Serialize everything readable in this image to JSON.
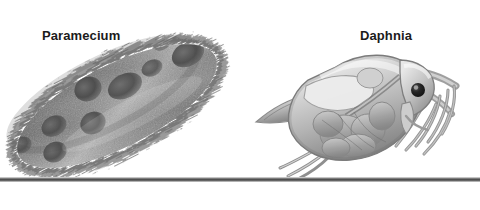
{
  "figure": {
    "background_color": "#ffffff",
    "width": 480,
    "height": 210,
    "style": "grayscale scientific illustration"
  },
  "labels": {
    "paramecium": "Paramecium",
    "daphnia": "Daphnia"
  },
  "organisms": [
    {
      "name": "Paramecium",
      "common_name": "slipper animalcule",
      "description": "Elongated cigar-shaped single-celled ciliate oriented diagonally from upper right to lower left, covered in a dense fringe of cilia, with granular cytoplasm and several dark rounded food vacuoles.",
      "orientation": "diagonal, upper-right to lower-left",
      "features": [
        "cilia fringe",
        "food vacuoles",
        "granular cytoplasm",
        "pellicle"
      ]
    },
    {
      "name": "Daphnia",
      "common_name": "water flea",
      "description": "Small crustacean shown in lateral view with a transparent bivalved carapace, large branched swimming antennae, a single dark compound eye, internal gut and brood chamber, a pointed tail spine and post-abdominal claws.",
      "orientation": "lateral view, head to the right",
      "features": [
        "carapace",
        "compound eye",
        "branched swimming antennae",
        "brood chamber",
        "gut",
        "tail spine",
        "post-abdominal claws"
      ]
    }
  ],
  "scale_line": {
    "name": "scale bar",
    "color": "#4f4f4f",
    "orientation": "horizontal",
    "spans_full_width": true
  },
  "colors": {
    "background": "#ffffff",
    "text": "#1b1b1b",
    "scale_line": "#4f4f4f",
    "organism_body_mid": "#8c8c8c",
    "organism_body_dark": "#4a4a4a",
    "organism_body_light": "#d6d6d6"
  }
}
